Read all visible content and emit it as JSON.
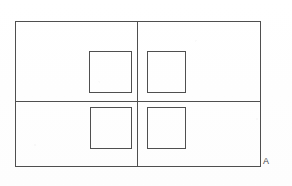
{
  "figure": {
    "background_color": "#fefefe",
    "stroke_color": "#4f4f4f",
    "stroke_width": 1.1,
    "canvas": {
      "width": 292,
      "height": 186
    }
  },
  "outer_frame": {
    "name": "outer-rectangle",
    "x": 15,
    "y": 21,
    "width": 245,
    "height": 145
  },
  "dividers": [
    {
      "name": "vertical-divider",
      "orientation": "vertical",
      "x": 137,
      "y1": 21,
      "y2": 166
    },
    {
      "name": "horizontal-divider",
      "orientation": "horizontal",
      "y": 101,
      "x1": 15,
      "x2": 260
    }
  ],
  "inner_squares": [
    {
      "name": "square-top-left",
      "quadrant": "top-left",
      "x": 89,
      "y": 51,
      "width": 42,
      "height": 41
    },
    {
      "name": "square-top-right",
      "quadrant": "top-right",
      "x": 147,
      "y": 51,
      "width": 38,
      "height": 41
    },
    {
      "name": "square-bottom-left",
      "quadrant": "bottom-left",
      "x": 90,
      "y": 107,
      "width": 41,
      "height": 41
    },
    {
      "name": "square-bottom-right",
      "quadrant": "bottom-right",
      "x": 147,
      "y": 107,
      "width": 38,
      "height": 41
    }
  ],
  "annotations": {
    "corner_label": "A",
    "corner_label_position": {
      "x": 265,
      "y": 160
    }
  }
}
